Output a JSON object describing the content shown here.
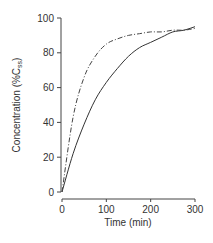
{
  "chart_data": {
    "type": "line",
    "title": "",
    "xlabel": "Time (min)",
    "ylabel": "Concentration (%C_ss)",
    "ylabel_main": "Concentration (%C",
    "ylabel_sub": "ss",
    "ylabel_close": ")",
    "xlim": [
      0,
      300
    ],
    "ylim": [
      0,
      100
    ],
    "xticks": [
      0,
      100,
      200,
      300
    ],
    "yticks": [
      0,
      20,
      40,
      60,
      80,
      100
    ],
    "grid": false,
    "legend": null,
    "x": [
      0,
      25,
      50,
      75,
      100,
      125,
      150,
      175,
      200,
      225,
      250,
      275,
      300
    ],
    "series": [
      {
        "name": "solid",
        "style": "solid",
        "values": [
          0,
          22,
          39,
          53,
          63,
          71,
          78,
          83,
          86,
          89,
          92,
          93,
          95
        ]
      },
      {
        "name": "dash-dot",
        "style": "dashdot",
        "values": [
          0,
          43,
          66,
          78,
          85,
          88,
          90,
          91,
          92,
          92,
          93,
          93,
          94
        ]
      }
    ]
  }
}
